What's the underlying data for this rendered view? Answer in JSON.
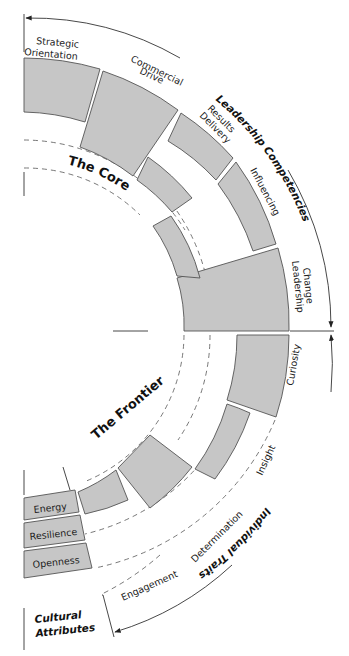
{
  "diagram": {
    "sections": {
      "leadership_competencies": "Leadership Competencies",
      "individual_traits": "Individual Traits",
      "cultural_attributes_line1": "Cultural",
      "cultural_attributes_line2": "Attributes"
    },
    "regions": {
      "core": "The Core",
      "frontier": "The Frontier"
    },
    "competencies": [
      {
        "line1": "Strategic",
        "line2": "Orientation"
      },
      {
        "line1": "Commercial",
        "line2": "Drive"
      },
      {
        "line1": "Results",
        "line2": "Delivery"
      },
      {
        "line1": "Influencing",
        "line2": ""
      },
      {
        "line1": "Change",
        "line2": "Leadership"
      }
    ],
    "traits": [
      "Curiosity",
      "Insight",
      "Determination",
      "Engagement"
    ],
    "cultural_attributes": [
      "Energy",
      "Resilience",
      "Openness"
    ],
    "colors": {
      "block_fill": "#c6c6c6",
      "block_stroke": "#555555",
      "line": "#333333"
    }
  }
}
